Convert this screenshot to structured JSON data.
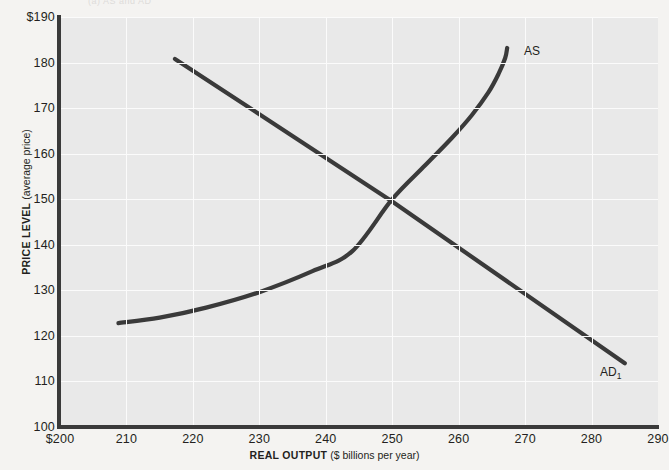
{
  "figure": {
    "cropped_header_text": "(a)  AS and AD",
    "background_color": "#f4f3f1",
    "plot_background_color": "#e9e9e9",
    "gridline_color": "#fbfbfb",
    "axis_color": "#3a3a3a",
    "curve_color": "#3a3a3a"
  },
  "chart_data": {
    "type": "line",
    "title": "",
    "xlabel_bold": "REAL OUTPUT",
    "xlabel_rest": " ($ billions per year)",
    "ylabel_bold": "PRICE LEVEL",
    "ylabel_rest": " (average price)",
    "xlim": [
      200,
      290
    ],
    "ylim": [
      100,
      190
    ],
    "xticks": [
      "$200",
      "210",
      "220",
      "230",
      "240",
      "250",
      "260",
      "270",
      "280",
      "290"
    ],
    "xtick_values": [
      200,
      210,
      220,
      230,
      240,
      250,
      260,
      270,
      280,
      290
    ],
    "yticks": [
      "$190",
      "180",
      "170",
      "160",
      "150",
      "140",
      "130",
      "120",
      "110",
      "100"
    ],
    "ytick_values": [
      190,
      180,
      170,
      160,
      150,
      140,
      130,
      120,
      110,
      100
    ],
    "grid": true,
    "legend_position": "inline-curve-labels",
    "equilibrium": {
      "output": 250,
      "price_level": 150
    },
    "series": [
      {
        "name": "AS",
        "label": "AS",
        "label_html": "AS",
        "description": "Aggregate supply curve, upward sloping and steepening to near-vertical at high output",
        "points": [
          [
            208.8,
            122.8
          ],
          [
            215,
            124.0
          ],
          [
            222,
            126.2
          ],
          [
            230,
            129.6
          ],
          [
            238,
            134.2
          ],
          [
            244,
            138.6
          ],
          [
            250,
            150.0
          ],
          [
            255,
            157.5
          ],
          [
            259,
            163.5
          ],
          [
            262,
            168.5
          ],
          [
            264.5,
            173.5
          ],
          [
            266,
            177.5
          ],
          [
            267,
            181.0
          ],
          [
            267.3,
            183.2
          ]
        ]
      },
      {
        "name": "AD1",
        "label": "AD1",
        "label_html": "AD<sub>1</sub>",
        "description": "Aggregate demand curve, downward sloping straight line",
        "points": [
          [
            217.3,
            180.8
          ],
          [
            250,
            149.5
          ],
          [
            285.0,
            114.0
          ]
        ]
      }
    ]
  }
}
